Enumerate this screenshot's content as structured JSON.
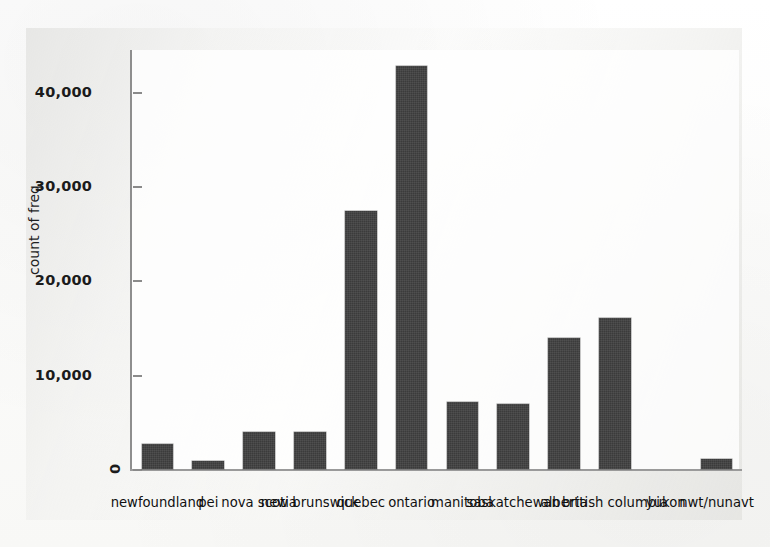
{
  "figure": {
    "kind": "bar-chart",
    "style": "scanned-grayscale",
    "bar_color": "#3b3b3b",
    "axis_color": "#8e8e8e",
    "text_color": "#1b1b1b",
    "background_color": "#fdfdfc"
  },
  "axes": {
    "y_title": "count of freq",
    "y_ticks": [
      "0",
      "10,000",
      "20,000",
      "30,000",
      "40,000"
    ],
    "zero_tick": "0"
  },
  "chart_data": {
    "type": "bar",
    "title": "",
    "subtitle": "",
    "xlabel": "",
    "ylabel": "count of freq",
    "ylim": [
      0,
      45000
    ],
    "yticks": [
      0,
      10000,
      20000,
      30000,
      40000
    ],
    "ytick_labels": [
      "0",
      "10,000",
      "20,000",
      "30,000",
      "40,000"
    ],
    "grid": false,
    "legend": false,
    "legend_position": "none",
    "categories": [
      "newfoundland",
      "pei",
      "nova scotia",
      "new brunswick",
      "quebec",
      "ontario",
      "manitoba",
      "saskatchewan",
      "alberta",
      "british columbia",
      "yukon",
      "nwt/nunavt"
    ],
    "values": [
      2700,
      800,
      3900,
      3900,
      27400,
      42800,
      7100,
      6900,
      13900,
      16000,
      0,
      1100
    ],
    "series": [
      {
        "name": "count of freq",
        "values": [
          2700,
          800,
          3900,
          3900,
          27400,
          42800,
          7100,
          6900,
          13900,
          16000,
          0,
          1100
        ]
      }
    ]
  }
}
